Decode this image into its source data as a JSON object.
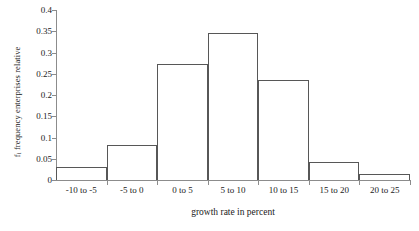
{
  "chart_data": {
    "type": "bar",
    "title": "",
    "xlabel": "growth rate in percent",
    "ylabel": "f, frequency enterprises relative",
    "ylabel_prefix": "f",
    "ylabel_subscript": "i",
    "ylabel_rest": " frequency enterprises relative",
    "categories": [
      "-10 to -5",
      "-5 to 0",
      "0 to 5",
      "5 to 10",
      "10 to 15",
      "15 to 20",
      "20 to 25"
    ],
    "values": [
      0.03,
      0.083,
      0.272,
      0.345,
      0.235,
      0.043,
      0.015
    ],
    "ylim": [
      0,
      0.4
    ],
    "ytick_labels": [
      "0",
      "0.05",
      "0.1",
      "0.15",
      "0.2",
      "0.25",
      "0.3",
      "0.35",
      "0.4"
    ],
    "ytick_values": [
      0,
      0.05,
      0.1,
      0.15,
      0.2,
      0.25,
      0.3,
      0.35,
      0.4
    ],
    "grid": false,
    "legend": false,
    "bar_fill": "#ffffff",
    "bar_outline": "#575757",
    "axis_color": "#8c8c8c"
  }
}
